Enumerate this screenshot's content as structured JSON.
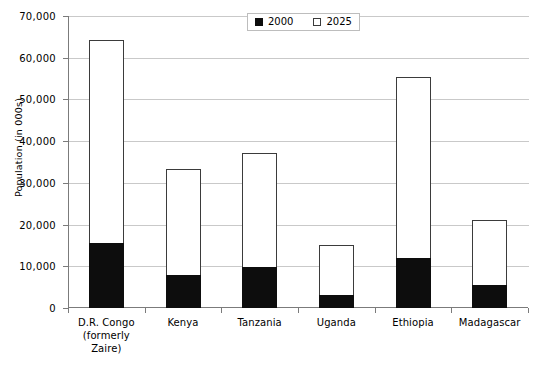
{
  "chart_data": {
    "type": "bar",
    "subtype": "overlapped-stacked",
    "title": "",
    "xlabel": "",
    "ylabel": "Population (in  000s)",
    "ylim": [
      0,
      70000
    ],
    "ytick_values": [
      0,
      10000,
      20000,
      30000,
      40000,
      50000,
      60000,
      70000
    ],
    "ytick_labels": [
      "0",
      "10,000",
      "20,000",
      "30,000",
      "40,000",
      "50,000",
      "60,000",
      "70,000"
    ],
    "grid": true,
    "legend_position": "top-center",
    "categories": [
      "D.R. Congo\n(formerly\nZaire)",
      "Kenya",
      "Tanzania",
      "Uganda",
      "Ethiopia",
      "Madagascar"
    ],
    "series": [
      {
        "name": "2000",
        "color": "#0d0d0d",
        "values": [
          15600,
          7800,
          9800,
          3200,
          12000,
          5500
        ]
      },
      {
        "name": "2025",
        "color": "#ffffff",
        "values": [
          64200,
          33300,
          37200,
          15200,
          55300,
          21000
        ]
      }
    ]
  },
  "legend": {
    "items": [
      {
        "label": "2000",
        "style": "filled"
      },
      {
        "label": "2025",
        "style": "hollow"
      }
    ]
  },
  "axis": {
    "y_title": "Population (in  000s)"
  },
  "categories_display": [
    [
      "D.R. Congo",
      "(formerly",
      "Zaire)"
    ],
    [
      "Kenya"
    ],
    [
      "Tanzania"
    ],
    [
      "Uganda"
    ],
    [
      "Ethiopia"
    ],
    [
      "Madagascar"
    ]
  ]
}
